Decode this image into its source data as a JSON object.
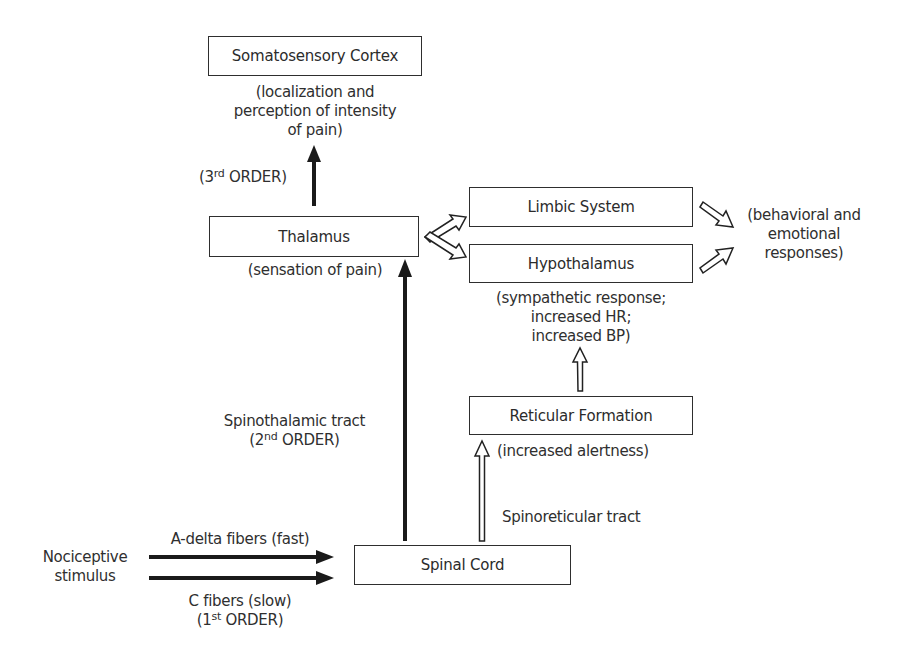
{
  "diagram": {
    "nodes": {
      "somatosensory_cortex": {
        "label": "Somatosensory Cortex",
        "note_lines": [
          "(localization and",
          "perception of intensity",
          "of pain)"
        ]
      },
      "thalamus": {
        "label": "Thalamus",
        "note": "(sensation of pain)"
      },
      "limbic_system": {
        "label": "Limbic System"
      },
      "hypothalamus": {
        "label": "Hypothalamus",
        "note_lines": [
          "(sympathetic response;",
          "increased HR;",
          "increased BP)"
        ]
      },
      "reticular_formation": {
        "label": "Reticular Formation",
        "note": "(increased alertness)"
      },
      "spinal_cord": {
        "label": "Spinal Cord"
      },
      "behavioral_responses": {
        "lines": [
          "(behavioral and",
          "emotional",
          "responses)"
        ]
      },
      "nociceptive_stimulus": {
        "lines": [
          "Nociceptive",
          "stimulus"
        ]
      }
    },
    "edge_labels": {
      "third_order": {
        "prefix": "(3",
        "sup": "rd",
        "suffix": " ORDER)"
      },
      "spinothalamic": {
        "name": "Spinothalamic tract",
        "order_prefix": "(2",
        "order_sup": "nd",
        "order_suffix": " ORDER)"
      },
      "spinoreticular": {
        "name": "Spinoreticular tract"
      },
      "a_delta": {
        "name": "A-delta fibers (fast)"
      },
      "c_fibers": {
        "name": "C fibers (slow)",
        "order_prefix": "(1",
        "order_sup": "st",
        "order_suffix": " ORDER)"
      }
    },
    "edges": [
      {
        "from": "nociceptive_stimulus",
        "to": "spinal_cord",
        "via": "A-delta fibers (fast)",
        "style": "solid"
      },
      {
        "from": "nociceptive_stimulus",
        "to": "spinal_cord",
        "via": "C fibers (slow)",
        "style": "solid"
      },
      {
        "from": "spinal_cord",
        "to": "thalamus",
        "via": "Spinothalamic tract",
        "style": "solid"
      },
      {
        "from": "thalamus",
        "to": "somatosensory_cortex",
        "via": "3rd ORDER",
        "style": "solid"
      },
      {
        "from": "spinal_cord",
        "to": "reticular_formation",
        "via": "Spinoreticular tract",
        "style": "hollow"
      },
      {
        "from": "reticular_formation",
        "to": "hypothalamus",
        "style": "hollow"
      },
      {
        "from": "thalamus",
        "to": "limbic_system",
        "style": "hollow"
      },
      {
        "from": "thalamus",
        "to": "hypothalamus",
        "style": "hollow"
      },
      {
        "from": "limbic_system",
        "to": "behavioral_responses",
        "style": "hollow"
      },
      {
        "from": "hypothalamus",
        "to": "behavioral_responses",
        "style": "hollow"
      }
    ],
    "colors": {
      "stroke": "#222222",
      "text": "#2f2f2f",
      "background": "#ffffff"
    }
  }
}
